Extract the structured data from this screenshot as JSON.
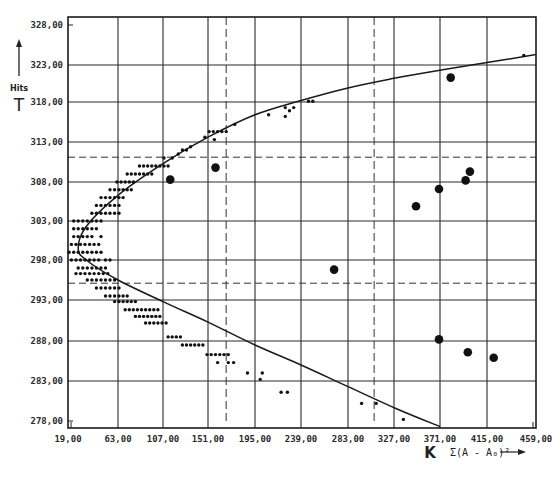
{
  "chart_data": {
    "type": "scatter",
    "title": "",
    "y_axis": {
      "label_word": "Hits",
      "label_symbol": "T",
      "ticks": [
        "328,00",
        "323,00",
        "318,00",
        "313,00",
        "308,00",
        "303,00",
        "298,00",
        "293,00",
        "288,00",
        "283,00",
        "278,00"
      ],
      "tick_values": [
        328,
        323,
        318,
        313,
        308,
        303,
        298,
        293,
        288,
        283,
        278
      ],
      "range": [
        277,
        329
      ]
    },
    "x_axis": {
      "label_symbol": "K",
      "label_expression": "Σ(A - A₀)²",
      "ticks": [
        "19,00",
        "63,00",
        "107,00",
        "151,00",
        "195,00",
        "239,00",
        "283,00",
        "327,00",
        "371,00",
        "415,00",
        "459,00"
      ],
      "tick_values": [
        19,
        63,
        107,
        151,
        195,
        239,
        283,
        327,
        371,
        415,
        459
      ],
      "range": [
        19,
        459
      ]
    },
    "grid": true,
    "reference_lines": {
      "horizontal_dashed": [
        311.1,
        295.1
      ],
      "vertical_dashed": [
        168,
        308
      ]
    },
    "fitted_curve": {
      "description": "parabola opening right, vertex near (28, 299)",
      "points": [
        [
          371,
          277.3
        ],
        [
          330,
          279.5
        ],
        [
          283,
          282.3
        ],
        [
          239,
          285
        ],
        [
          195,
          287.5
        ],
        [
          151,
          290.3
        ],
        [
          107,
          292.8
        ],
        [
          63,
          295.5
        ],
        [
          35,
          298
        ],
        [
          28,
          299.5
        ],
        [
          35,
          302.3
        ],
        [
          63,
          306.3
        ],
        [
          107,
          310.3
        ],
        [
          151,
          313.6
        ],
        [
          195,
          316.4
        ],
        [
          239,
          318.2
        ],
        [
          283,
          319.9
        ],
        [
          327,
          321.2
        ],
        [
          371,
          322.3
        ],
        [
          415,
          323.3
        ],
        [
          459,
          324.3
        ]
      ]
    },
    "series": [
      {
        "name": "small-dots",
        "marker": "small",
        "points": [
          [
            24,
            303
          ],
          [
            28,
            303
          ],
          [
            32,
            303
          ],
          [
            36,
            303
          ],
          [
            40,
            303
          ],
          [
            44,
            303
          ],
          [
            48,
            303
          ],
          [
            24,
            302
          ],
          [
            28,
            302
          ],
          [
            32,
            302
          ],
          [
            36,
            302
          ],
          [
            40,
            302
          ],
          [
            44,
            302
          ],
          [
            24,
            301
          ],
          [
            28,
            301
          ],
          [
            32,
            301
          ],
          [
            36,
            301
          ],
          [
            40,
            301
          ],
          [
            48,
            301
          ],
          [
            22,
            300
          ],
          [
            26,
            300
          ],
          [
            30,
            300
          ],
          [
            34,
            300
          ],
          [
            38,
            300
          ],
          [
            42,
            300
          ],
          [
            46,
            300
          ],
          [
            20,
            299
          ],
          [
            24,
            299
          ],
          [
            28,
            299
          ],
          [
            32,
            299
          ],
          [
            36,
            299
          ],
          [
            40,
            299
          ],
          [
            44,
            299
          ],
          [
            48,
            299
          ],
          [
            22,
            298
          ],
          [
            26,
            298
          ],
          [
            30,
            298
          ],
          [
            34,
            298
          ],
          [
            38,
            298
          ],
          [
            42,
            298
          ],
          [
            46,
            298
          ],
          [
            52,
            298
          ],
          [
            56,
            298
          ],
          [
            28,
            297
          ],
          [
            32,
            297
          ],
          [
            36,
            297
          ],
          [
            40,
            297
          ],
          [
            44,
            297
          ],
          [
            48,
            297
          ],
          [
            52,
            297
          ],
          [
            26,
            296.3
          ],
          [
            30,
            296.3
          ],
          [
            34,
            296.3
          ],
          [
            38,
            296.3
          ],
          [
            42,
            296.3
          ],
          [
            46,
            296.3
          ],
          [
            50,
            296.3
          ],
          [
            54,
            296.3
          ],
          [
            36,
            295.5
          ],
          [
            40,
            295.5
          ],
          [
            44,
            295.5
          ],
          [
            48,
            295.5
          ],
          [
            52,
            295.5
          ],
          [
            56,
            295.5
          ],
          [
            60,
            295.5
          ],
          [
            44,
            294.5
          ],
          [
            48,
            294.5
          ],
          [
            52,
            294.5
          ],
          [
            56,
            294.5
          ],
          [
            60,
            294.5
          ],
          [
            64,
            294.5
          ],
          [
            52,
            293.5
          ],
          [
            56,
            293.5
          ],
          [
            60,
            293.5
          ],
          [
            64,
            293.5
          ],
          [
            68,
            293.5
          ],
          [
            72,
            293.5
          ],
          [
            60,
            292.8
          ],
          [
            64,
            292.8
          ],
          [
            68,
            292.8
          ],
          [
            72,
            292.8
          ],
          [
            76,
            292.8
          ],
          [
            80,
            292.8
          ],
          [
            70,
            291.8
          ],
          [
            74,
            291.8
          ],
          [
            78,
            291.8
          ],
          [
            82,
            291.8
          ],
          [
            86,
            291.8
          ],
          [
            90,
            291.8
          ],
          [
            94,
            291.8
          ],
          [
            98,
            291.8
          ],
          [
            102,
            291.8
          ],
          [
            80,
            291
          ],
          [
            84,
            291
          ],
          [
            88,
            291
          ],
          [
            92,
            291
          ],
          [
            96,
            291
          ],
          [
            100,
            291
          ],
          [
            104,
            291
          ],
          [
            90,
            290.2
          ],
          [
            94,
            290.2
          ],
          [
            98,
            290.2
          ],
          [
            102,
            290.2
          ],
          [
            106,
            290.2
          ],
          [
            110,
            290.2
          ],
          [
            112,
            288.5
          ],
          [
            116,
            288.5
          ],
          [
            120,
            288.5
          ],
          [
            124,
            288.5
          ],
          [
            126,
            287.5
          ],
          [
            130,
            287.5
          ],
          [
            134,
            287.5
          ],
          [
            138,
            287.5
          ],
          [
            142,
            287.5
          ],
          [
            146,
            287.5
          ],
          [
            150,
            286.3
          ],
          [
            154,
            286.3
          ],
          [
            158,
            286.3
          ],
          [
            162,
            286.3
          ],
          [
            166,
            286.3
          ],
          [
            170,
            286.3
          ],
          [
            160,
            285.3
          ],
          [
            170,
            285.3
          ],
          [
            175,
            285.3
          ],
          [
            188,
            284
          ],
          [
            202,
            284
          ],
          [
            200,
            283.2
          ],
          [
            220,
            281.6
          ],
          [
            226,
            281.6
          ],
          [
            296,
            280.2
          ],
          [
            310,
            280.2
          ],
          [
            336,
            278.2
          ],
          [
            40,
            304
          ],
          [
            44,
            304
          ],
          [
            48,
            304
          ],
          [
            52,
            304
          ],
          [
            56,
            304
          ],
          [
            60,
            304
          ],
          [
            64,
            304
          ],
          [
            44,
            305
          ],
          [
            48,
            305
          ],
          [
            52,
            305
          ],
          [
            56,
            305
          ],
          [
            60,
            305
          ],
          [
            64,
            305
          ],
          [
            48,
            306
          ],
          [
            52,
            306
          ],
          [
            56,
            306
          ],
          [
            60,
            306
          ],
          [
            64,
            306
          ],
          [
            68,
            306
          ],
          [
            56,
            307
          ],
          [
            60,
            307
          ],
          [
            64,
            307
          ],
          [
            68,
            307
          ],
          [
            72,
            307
          ],
          [
            76,
            307
          ],
          [
            62,
            308
          ],
          [
            66,
            308
          ],
          [
            70,
            308
          ],
          [
            74,
            308
          ],
          [
            78,
            308
          ],
          [
            72,
            309
          ],
          [
            76,
            309
          ],
          [
            80,
            309
          ],
          [
            84,
            309
          ],
          [
            88,
            309
          ],
          [
            92,
            309
          ],
          [
            96,
            309
          ],
          [
            84,
            310
          ],
          [
            88,
            310
          ],
          [
            92,
            310
          ],
          [
            96,
            310
          ],
          [
            100,
            310
          ],
          [
            104,
            310
          ],
          [
            108,
            310
          ],
          [
            112,
            310
          ],
          [
            108,
            311
          ],
          [
            116,
            311
          ],
          [
            122,
            311.5
          ],
          [
            126,
            312
          ],
          [
            130,
            312
          ],
          [
            134,
            312.4
          ],
          [
            148,
            313.6
          ],
          [
            152,
            314.3
          ],
          [
            156,
            314.3
          ],
          [
            160,
            314.3
          ],
          [
            164,
            314.3
          ],
          [
            168,
            314.3
          ],
          [
            157,
            313.3
          ],
          [
            176,
            315.2
          ],
          [
            208,
            316.4
          ],
          [
            224,
            316.2
          ],
          [
            228,
            316.9
          ],
          [
            232,
            317.3
          ],
          [
            224,
            317.3
          ],
          [
            246,
            318.1
          ],
          [
            250,
            318.1
          ],
          [
            448,
            324.2
          ]
        ]
      },
      {
        "name": "large-dots",
        "marker": "large",
        "points": [
          [
            114,
            308.3
          ],
          [
            158,
            309.8
          ],
          [
            270,
            296.8
          ],
          [
            381,
            321.3
          ],
          [
            348,
            304.9
          ],
          [
            370,
            307.1
          ],
          [
            395,
            308.2
          ],
          [
            399,
            309.3
          ],
          [
            370,
            288.2
          ],
          [
            397,
            286.6
          ],
          [
            421,
            285.9
          ]
        ]
      }
    ],
    "legend": null
  }
}
